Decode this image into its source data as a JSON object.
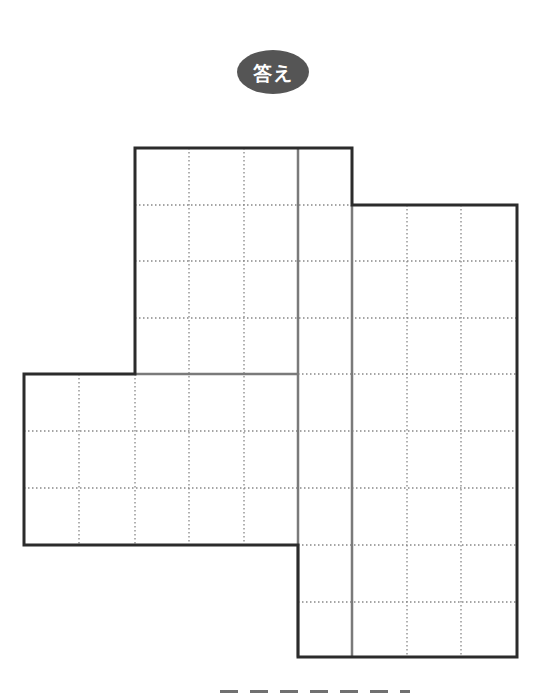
{
  "badge": {
    "label": "答え",
    "color": "#555555"
  },
  "figure": {
    "cell_size_px": [
      54.5,
      56.5
    ],
    "x_lines": [
      24,
      79,
      135,
      189,
      244,
      298,
      352,
      407,
      461,
      517
    ],
    "y_lines": [
      148,
      205,
      261,
      318,
      374,
      431,
      488,
      545,
      602,
      657
    ],
    "regions": [
      {
        "name": "top-block",
        "cols": 3,
        "rows": 4
      },
      {
        "name": "left-block",
        "cols": 5,
        "rows": 3
      },
      {
        "name": "middle-column",
        "cols": 1,
        "rows": 9
      },
      {
        "name": "right-block",
        "cols": 3,
        "rows": 8
      }
    ],
    "outline_color": "#2b2b2b",
    "partition_color": "#7a7a7a",
    "dotted_color": "#888888"
  },
  "caption": {
    "text": "",
    "note": "caption text clipped at bottom edge, not legible"
  }
}
